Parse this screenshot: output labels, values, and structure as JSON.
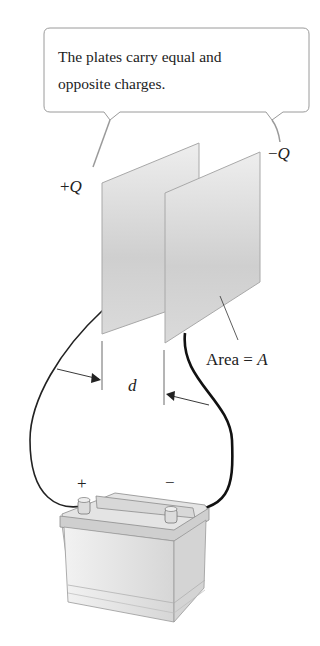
{
  "callout": {
    "line1": "The plates carry equal and",
    "line2": "opposite charges."
  },
  "labels": {
    "plus_q_sign": "+",
    "plus_q_var": "Q",
    "minus_q_sign": "−",
    "minus_q_var": "Q",
    "separation": "d",
    "area_text": "Area = ",
    "area_var": "A",
    "battery_plus": "+",
    "battery_minus": "−"
  },
  "colors": {
    "plate": "#d8d8d8",
    "line": "#222222",
    "callout_border": "#9a9a9a"
  }
}
